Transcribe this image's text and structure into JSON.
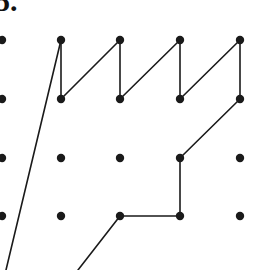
{
  "figure": {
    "item_number_label": "5.",
    "caption": "",
    "width": 271,
    "height": 270,
    "background_color": "#ffffff",
    "ink_color": "#1a1a1a",
    "dot_radius": 4.2,
    "line_width": 1.6
  },
  "grid": {
    "description": "Partially cropped rectangular array of dots (geoboard pegs).",
    "column_x": [
      2,
      61,
      120,
      180,
      240
    ],
    "row_y": [
      40,
      99,
      158,
      216
    ],
    "column_spacing": 59.5,
    "row_spacing": 58.7,
    "dots": [
      {
        "col": 0,
        "row": 0,
        "x": 2,
        "y": 40,
        "clipped": true
      },
      {
        "col": 0,
        "row": 1,
        "x": 2,
        "y": 99,
        "clipped": true
      },
      {
        "col": 0,
        "row": 2,
        "x": 2,
        "y": 158,
        "clipped": true
      },
      {
        "col": 0,
        "row": 3,
        "x": 2,
        "y": 216,
        "clipped": true
      },
      {
        "col": 1,
        "row": 0,
        "x": 61,
        "y": 40,
        "clipped": false
      },
      {
        "col": 1,
        "row": 1,
        "x": 61,
        "y": 99,
        "clipped": false
      },
      {
        "col": 1,
        "row": 2,
        "x": 61,
        "y": 158,
        "clipped": false
      },
      {
        "col": 1,
        "row": 3,
        "x": 61,
        "y": 216,
        "clipped": false
      },
      {
        "col": 2,
        "row": 0,
        "x": 120,
        "y": 40,
        "clipped": false
      },
      {
        "col": 2,
        "row": 1,
        "x": 120,
        "y": 99,
        "clipped": false
      },
      {
        "col": 2,
        "row": 2,
        "x": 120,
        "y": 158,
        "clipped": false
      },
      {
        "col": 2,
        "row": 3,
        "x": 120,
        "y": 216,
        "clipped": false
      },
      {
        "col": 3,
        "row": 0,
        "x": 180,
        "y": 40,
        "clipped": false
      },
      {
        "col": 3,
        "row": 1,
        "x": 180,
        "y": 99,
        "clipped": false
      },
      {
        "col": 3,
        "row": 2,
        "x": 180,
        "y": 158,
        "clipped": false
      },
      {
        "col": 3,
        "row": 3,
        "x": 180,
        "y": 216,
        "clipped": false
      },
      {
        "col": 4,
        "row": 0,
        "x": 240,
        "y": 40,
        "clipped": false
      },
      {
        "col": 4,
        "row": 1,
        "x": 240,
        "y": 99,
        "clipped": false
      },
      {
        "col": 4,
        "row": 2,
        "x": 240,
        "y": 158,
        "clipped": false
      },
      {
        "col": 4,
        "row": 3,
        "x": 240,
        "y": 216,
        "clipped": false
      }
    ]
  },
  "shape": {
    "name": "zigzag-crown-polygon",
    "description": "Open polyline forming a saw-tooth crown across the top two rows, stepping down the right side and running off the bottom edge on the left.",
    "segments": [
      {
        "id": "seg-left-long-diagonal",
        "kind": "diagonal",
        "from": [
          61,
          40
        ],
        "to": [
          6,
          270
        ],
        "clipped_at_bottom": true
      },
      {
        "id": "seg-v1",
        "kind": "vertical",
        "from": [
          61,
          40
        ],
        "to": [
          61,
          99
        ]
      },
      {
        "id": "seg-d1",
        "kind": "diagonal",
        "from": [
          61,
          99
        ],
        "to": [
          120,
          40
        ]
      },
      {
        "id": "seg-v2",
        "kind": "vertical",
        "from": [
          120,
          40
        ],
        "to": [
          120,
          99
        ]
      },
      {
        "id": "seg-d2",
        "kind": "diagonal",
        "from": [
          120,
          99
        ],
        "to": [
          180,
          40
        ]
      },
      {
        "id": "seg-v3",
        "kind": "vertical",
        "from": [
          180,
          40
        ],
        "to": [
          180,
          99
        ]
      },
      {
        "id": "seg-d3",
        "kind": "diagonal",
        "from": [
          180,
          99
        ],
        "to": [
          240,
          40
        ]
      },
      {
        "id": "seg-v4",
        "kind": "vertical",
        "from": [
          240,
          40
        ],
        "to": [
          240,
          99
        ]
      },
      {
        "id": "seg-d4",
        "kind": "diagonal",
        "from": [
          240,
          99
        ],
        "to": [
          180,
          158
        ]
      },
      {
        "id": "seg-v5",
        "kind": "vertical",
        "from": [
          180,
          158
        ],
        "to": [
          180,
          216
        ]
      },
      {
        "id": "seg-h1",
        "kind": "horizontal",
        "from": [
          180,
          216
        ],
        "to": [
          120,
          216
        ]
      },
      {
        "id": "seg-bottom-diagonal",
        "kind": "diagonal",
        "from": [
          120,
          216
        ],
        "to": [
          78,
          270
        ],
        "clipped_at_bottom": true
      }
    ],
    "vertices": [
      [
        61,
        40
      ],
      [
        61,
        99
      ],
      [
        120,
        40
      ],
      [
        120,
        99
      ],
      [
        180,
        40
      ],
      [
        180,
        99
      ],
      [
        240,
        40
      ],
      [
        240,
        99
      ],
      [
        180,
        158
      ],
      [
        180,
        216
      ],
      [
        120,
        216
      ]
    ]
  }
}
